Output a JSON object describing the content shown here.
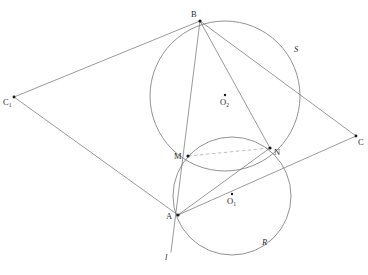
{
  "figure": {
    "type": "euclidean-geometry-diagram",
    "background_color": "#ffffff",
    "stroke_color": "#6e6e6e",
    "label_color": "#2b2b2b"
  },
  "points": [
    {
      "id": "B",
      "label": "B",
      "x": 200,
      "y": 21,
      "label_dx": -9,
      "label_dy": -11
    },
    {
      "id": "C1",
      "label": "C",
      "sub": "1",
      "x": 14,
      "y": 97,
      "label_dx": -11,
      "label_dy": 1
    },
    {
      "id": "C",
      "label": "C",
      "x": 356,
      "y": 136,
      "label_dx": 2,
      "label_dy": 2
    },
    {
      "id": "M",
      "label": "M",
      "x": 188,
      "y": 156,
      "label_dx": -14,
      "label_dy": -4
    },
    {
      "id": "N",
      "label": "N",
      "x": 270,
      "y": 148,
      "label_dx": 4,
      "label_dy": 0
    },
    {
      "id": "A",
      "label": "A",
      "x": 178,
      "y": 215,
      "label_dx": -12,
      "label_dy": -3
    },
    {
      "id": "O2",
      "label": "O",
      "sub": "2",
      "x": 225,
      "y": 95,
      "label_dx": -3,
      "label_dy": 3
    },
    {
      "id": "O1",
      "label": "O",
      "sub": "1",
      "x": 232,
      "y": 194,
      "label_dx": -3,
      "label_dy": 3
    }
  ],
  "circles": [
    {
      "id": "circle-upper",
      "center_x": 225,
      "center_y": 96,
      "radius": 75,
      "through": [
        "B",
        "M",
        "N"
      ],
      "arc_label": "S"
    },
    {
      "id": "circle-lower",
      "center_x": 232,
      "center_y": 196,
      "radius": 59,
      "through": [
        "M",
        "N",
        "A"
      ],
      "arc_label": "R"
    }
  ],
  "arc_labels": [
    {
      "id": "S",
      "text": "S",
      "x": 294,
      "y": 50
    },
    {
      "id": "R",
      "text": "R",
      "x": 262,
      "y": 243
    }
  ],
  "line_label": {
    "id": "l",
    "text": "l",
    "x": 165,
    "y": 258
  },
  "segments": [
    {
      "id": "B-C1",
      "from": "B",
      "to": "C1",
      "style": "solid"
    },
    {
      "id": "B-C",
      "from": "B",
      "to": "C",
      "style": "solid"
    },
    {
      "id": "C1-A",
      "from": "C1",
      "to": "A",
      "style": "solid"
    },
    {
      "id": "A-C",
      "from": "A",
      "to": "C",
      "style": "solid"
    },
    {
      "id": "B-N",
      "from": "B",
      "to": "N",
      "style": "solid"
    },
    {
      "id": "B-A",
      "from": "B",
      "to": "A",
      "style": "solid"
    },
    {
      "id": "A-N",
      "from": "A",
      "to": "N",
      "style": "solid"
    },
    {
      "id": "M-N",
      "from": "M",
      "to": "N",
      "style": "dashed"
    },
    {
      "id": "line-l",
      "from": "B",
      "to": "l-end",
      "style": "solid",
      "note": "line through B, M, A extended to label l"
    }
  ],
  "colors": {
    "stroke": "#6e6e6e",
    "dashed_stroke": "#9a9a9a",
    "point_fill": "#1a1a1a",
    "label": "#2b2b2b",
    "background": "#ffffff"
  }
}
